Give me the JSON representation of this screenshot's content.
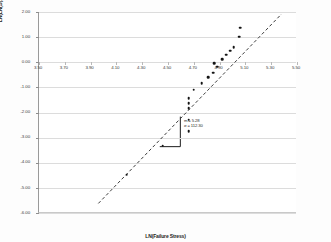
{
  "chart_data": {
    "type": "scatter",
    "title": "",
    "xlabel": "LN(Failure Stress)",
    "ylabel": "LN(LN(1/(1-Probability of Failure)))",
    "xlim": [
      3.5,
      5.5
    ],
    "ylim": [
      -6.0,
      2.0
    ],
    "xticks": [
      "3.50",
      "3.70",
      "3.90",
      "4.10",
      "4.30",
      "4.50",
      "4.70",
      "4.90",
      "5.10",
      "5.30",
      "5.50"
    ],
    "xtick_values": [
      3.5,
      3.7,
      3.9,
      4.1,
      4.3,
      4.5,
      4.7,
      4.9,
      5.1,
      5.3,
      5.5
    ],
    "yticks": [
      "2.00",
      "1.00",
      "0.00",
      "-1.00",
      "-2.00",
      "-3.00",
      "-4.00",
      "-5.00",
      "-6.00"
    ],
    "ytick_values": [
      2.0,
      1.0,
      0.0,
      -1.0,
      -2.0,
      -3.0,
      -4.0,
      -5.0,
      -6.0
    ],
    "grid": true,
    "legend": "none",
    "series": [
      {
        "name": "Weibull data points",
        "marker": "filled-circle",
        "color": "#141414",
        "points": [
          {
            "x": 4.18,
            "y": -4.48
          },
          {
            "x": 4.46,
            "y": -3.32
          },
          {
            "x": 4.66,
            "y": -2.74
          },
          {
            "x": 4.66,
            "y": -2.28
          },
          {
            "x": 4.66,
            "y": -1.82
          },
          {
            "x": 4.66,
            "y": -1.64
          },
          {
            "x": 4.66,
            "y": -1.42
          },
          {
            "x": 4.7,
            "y": -1.1
          },
          {
            "x": 4.76,
            "y": -0.84
          },
          {
            "x": 4.81,
            "y": -0.6
          },
          {
            "x": 4.85,
            "y": -0.42
          },
          {
            "x": 4.86,
            "y": -0.04
          },
          {
            "x": 4.88,
            "y": -0.18
          },
          {
            "x": 4.92,
            "y": 0.12
          },
          {
            "x": 4.95,
            "y": 0.3
          },
          {
            "x": 4.98,
            "y": 0.46
          },
          {
            "x": 5.01,
            "y": 0.6
          },
          {
            "x": 5.05,
            "y": 1.02
          },
          {
            "x": 5.06,
            "y": 1.38
          }
        ]
      }
    ],
    "trendline": {
      "style": "dashed",
      "color": "#3d3d3d",
      "x_start": 3.96,
      "y_start": -5.62,
      "x_end": 5.38,
      "y_end": 1.92,
      "slope": 5.28
    },
    "annotations": {
      "slope_indicator": {
        "shape": "step",
        "color": "#1a1a1a",
        "x_left": 4.44,
        "x_right": 4.6,
        "y_bottom": -3.38,
        "y_top": -2.18
      },
      "parameters": [
        "m = 5.28",
        "σ = 112.30"
      ]
    }
  }
}
